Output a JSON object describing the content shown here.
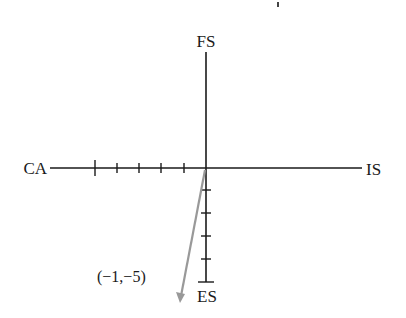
{
  "diagram": {
    "type": "coordinate-axes-with-vector",
    "axes": {
      "top": "FS",
      "bottom": "ES",
      "left": "CA",
      "right": "IS"
    },
    "ticks": {
      "left_count": 5,
      "down_count": 5
    },
    "vector": {
      "label": "(−1,−5)",
      "x": -1,
      "y": -5,
      "color": "#999999"
    },
    "colors": {
      "axis": "#1a1a1a",
      "vector": "#999999",
      "background": "#ffffff"
    }
  }
}
